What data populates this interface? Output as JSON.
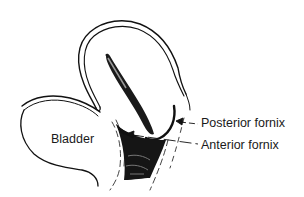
{
  "figure": {
    "type": "anatomical-diagram",
    "labels": {
      "bladder": "Bladder",
      "posterior_fornix": "Posterior fornix",
      "anterior_fornix": "Anterior fornix"
    },
    "colors": {
      "ink": "#111111",
      "background": "#ffffff"
    }
  }
}
